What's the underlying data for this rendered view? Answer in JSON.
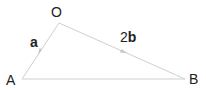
{
  "diagram": {
    "type": "vector-triangle",
    "colors": {
      "line": "#cfcfcf",
      "arrow": "#c4c4c4",
      "text": "#222222",
      "background": "#ffffff"
    },
    "vertices": {
      "O": {
        "label": "O",
        "x": 59,
        "y": 23
      },
      "A": {
        "label": "A",
        "x": 22,
        "y": 79
      },
      "B": {
        "label": "B",
        "x": 185,
        "y": 79
      }
    },
    "edges": [
      {
        "from": "O",
        "to": "A",
        "vector_label": "a",
        "coefficient": "",
        "symbol": "a"
      },
      {
        "from": "O",
        "to": "B",
        "vector_label": "2b",
        "coefficient": "2",
        "symbol": "b"
      },
      {
        "from": "A",
        "to": "B",
        "vector_label": ""
      }
    ],
    "labels": {
      "O": "O",
      "A": "A",
      "B": "B",
      "vec_a": "a",
      "vec_2b_coef": "2",
      "vec_2b_sym": "b"
    }
  }
}
